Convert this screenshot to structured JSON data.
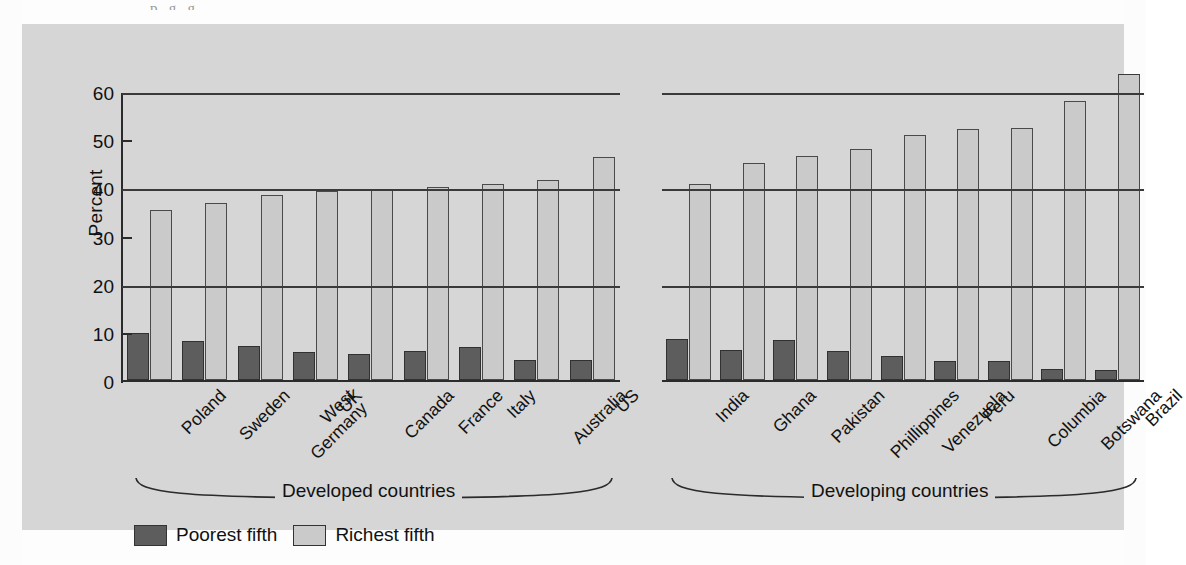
{
  "axis": {
    "y_title": "Percent",
    "y_ticks": [
      0,
      10,
      20,
      30,
      40,
      50,
      60
    ],
    "y_tick_labels": [
      "0",
      "10",
      "20",
      "30",
      "40",
      "50",
      "60"
    ],
    "y_min": 0,
    "y_max": 60,
    "gridline_values": [
      20,
      40,
      60
    ],
    "tickmark_only_values": [
      10,
      30,
      50
    ]
  },
  "groups": [
    {
      "name": "developed",
      "brace_label": "Developed countries"
    },
    {
      "name": "developing",
      "brace_label": "Developing countries"
    }
  ],
  "legend": {
    "items": [
      {
        "label": "Poorest fifth",
        "color": "#5d5d5d",
        "swatch": "dark-gray-swatch"
      },
      {
        "label": "Richest fifth",
        "color": "#cacaca",
        "swatch": "light-gray-swatch"
      }
    ]
  },
  "colors": {
    "poorest_fifth": "#5d5d5d",
    "richest_fifth": "#cacaca",
    "panel_background": "#d6d6d6",
    "axis_line": "#2b2b2b",
    "gridline": "#3a3a3a",
    "page_background": "#fdfdfd"
  },
  "chart_data": {
    "type": "bar",
    "title": "",
    "subtitle": "",
    "xlabel": "",
    "ylabel": "Percent",
    "ylim": [
      0,
      60
    ],
    "grid": true,
    "grid_values": [
      20,
      40,
      60
    ],
    "legend_position": "bottom-left",
    "panels": [
      {
        "label": "Developed countries",
        "categories": [
          "Poland",
          "Sweden",
          "West\nGermany",
          "UK",
          "Canada",
          "France",
          "Italy",
          "Australia",
          "US"
        ],
        "series": [
          {
            "name": "Poorest fifth",
            "values": [
              9.7,
              8.0,
              7.0,
              5.8,
              5.5,
              6.1,
              6.9,
              4.2,
              4.2
            ]
          },
          {
            "name": "Richest fifth",
            "values": [
              35.2,
              36.7,
              38.4,
              39.3,
              39.4,
              40.0,
              40.6,
              41.6,
              46.4
            ]
          }
        ]
      },
      {
        "label": "Developing countries",
        "categories": [
          "India",
          "Ghana",
          "Pakistan",
          "Phillippines",
          "Venezuela",
          "Peru",
          "Columbia",
          "Botswana",
          "Brazil"
        ],
        "series": [
          {
            "name": "Poorest fifth",
            "values": [
              8.5,
              6.2,
              8.3,
              6.1,
              4.9,
              4.0,
              4.0,
              2.3,
              2.1
            ]
          },
          {
            "name": "Richest fifth",
            "values": [
              40.7,
              45.0,
              46.5,
              48.0,
              50.8,
              52.2,
              52.3,
              58.0,
              63.5
            ]
          }
        ]
      }
    ]
  },
  "caption_descenders": "p    ,   g   ,  g  ,  ,"
}
